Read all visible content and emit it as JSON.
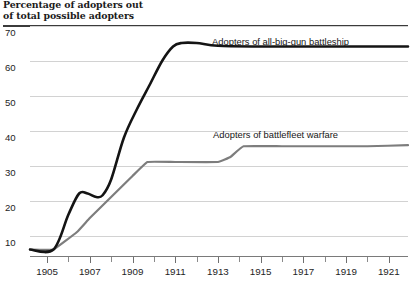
{
  "title": {
    "line1": "Percentage of adopters out",
    "line2": "of total possible adopters"
  },
  "series_labels": {
    "big_gun": "Adopters of all-big-gun battleship",
    "battlefleet": "Adopters of battlefleet warfare"
  },
  "colors": {
    "big_gun": "#141414",
    "battlefleet": "#7d7d7d",
    "grid": "#d2d2d2",
    "rule": "#3b3b3b",
    "axis": "#7a7a7a",
    "text": "#1d1d1d"
  },
  "axes": {
    "y_ticks": [
      10,
      20,
      30,
      40,
      50,
      60,
      70
    ],
    "y_min": 0,
    "y_max": 73,
    "x_min": 1904.2,
    "x_max": 1921.9,
    "x_major_labels": [
      1905,
      1907,
      1909,
      1911,
      1913,
      1915,
      1917,
      1919,
      1921
    ],
    "x_minor_ticks": [
      1905,
      1906,
      1907,
      1908,
      1909,
      1910,
      1911,
      1912,
      1913,
      1914,
      1915,
      1916,
      1917,
      1918,
      1919,
      1920,
      1921
    ]
  },
  "chart_data": {
    "type": "line",
    "title": "Percentage of adopters out of total possible adopters",
    "xlabel": "",
    "ylabel": "Percentage of adopters out of total possible adopters",
    "xlim": [
      1904.2,
      1921.9
    ],
    "ylim": [
      0,
      73
    ],
    "grid": true,
    "legend": "inline-labels",
    "yticks": [
      10,
      20,
      30,
      40,
      50,
      60,
      70
    ],
    "xticks": [
      1905,
      1907,
      1909,
      1911,
      1913,
      1915,
      1917,
      1919,
      1921
    ],
    "series": [
      {
        "name": "Adopters of all-big-gun battleship",
        "color": "#141414",
        "x": [
          1904.2,
          1905.3,
          1906.0,
          1906.5,
          1906.9,
          1907.3,
          1907.6,
          1908.0,
          1908.6,
          1909.2,
          1909.8,
          1910.4,
          1910.9,
          1911.3,
          1912.0,
          1913.0,
          1915.0,
          1917.0,
          1919.0,
          1921.9
        ],
        "values": [
          6,
          6,
          16,
          22,
          22,
          21,
          21.5,
          26,
          38,
          46,
          53,
          60,
          64,
          65,
          65,
          64.2,
          64,
          64,
          64,
          64
        ]
      },
      {
        "name": "Adopters of battlefleet warfare",
        "color": "#7d7d7d",
        "x": [
          1904.2,
          1905.3,
          1906.4,
          1907.0,
          1908.0,
          1909.0,
          1909.7,
          1911.0,
          1913.0,
          1913.6,
          1914.2,
          1916.0,
          1918.0,
          1920.0,
          1921.9
        ],
        "values": [
          6,
          6,
          11,
          15,
          21,
          27,
          31,
          31,
          31,
          32.5,
          35.5,
          35.5,
          35.5,
          35.5,
          35.8
        ]
      }
    ]
  }
}
